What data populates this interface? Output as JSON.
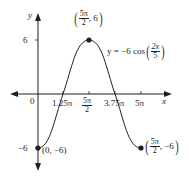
{
  "diagram": {
    "type": "function-graph",
    "equation": {
      "prefix": "y = −6 cos",
      "arg_num": "2x",
      "arg_den": "5"
    },
    "axes": {
      "x_label": "x",
      "y_label": "y",
      "origin_label": "0"
    },
    "x_ticks": [
      {
        "label": "1.25π"
      },
      {
        "label_num": "5π",
        "label_den": "2"
      },
      {
        "label": "3.75π"
      },
      {
        "label": "5π"
      }
    ],
    "y_ticks": [
      {
        "label": "6"
      },
      {
        "label": "−6"
      }
    ],
    "points": [
      {
        "name": "start",
        "text": "(0, −6)"
      },
      {
        "name": "max",
        "x_num": "5π",
        "x_den": "2",
        "y": "6"
      },
      {
        "name": "end",
        "x_num": "5π",
        "x_den": "2",
        "y": "−6"
      }
    ],
    "colors": {
      "curve": "#231f20",
      "axes": "#231f20",
      "background": "#ffffff"
    }
  }
}
